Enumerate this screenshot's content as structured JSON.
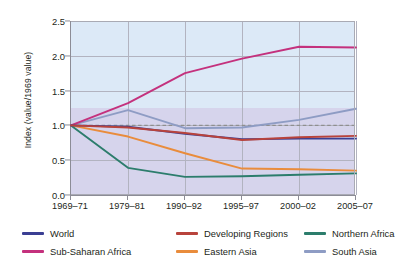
{
  "chart_data": {
    "type": "line",
    "title": "",
    "xlabel": "",
    "ylabel": "Index  (value/1969 value)",
    "categories": [
      "1969–71",
      "1979–81",
      "1990–92",
      "1995–97",
      "2000–02",
      "2005–07"
    ],
    "ylim": [
      0.0,
      2.5
    ],
    "yticks": [
      "0.0",
      "0.5",
      "1.0",
      "1.5",
      "2.0",
      "2.5"
    ],
    "ytick_values": [
      0.0,
      0.5,
      1.0,
      1.5,
      2.0,
      2.5
    ],
    "grid": "both",
    "legend_position": "bottom",
    "reference_line": {
      "value": 1.0,
      "style": "dashed",
      "color": "#8f8f8f"
    },
    "background_bands": [
      {
        "range": [
          1.0,
          2.5
        ],
        "color": "#dce9f7"
      },
      {
        "range": [
          0.0,
          1.0
        ],
        "color": "#d6d4ec"
      }
    ],
    "series": [
      {
        "name": "World",
        "color": "#3b3f93",
        "values": [
          1.0,
          0.98,
          0.88,
          0.8,
          0.81,
          0.81
        ]
      },
      {
        "name": "Sub-Saharan Africa",
        "color": "#c4317d",
        "values": [
          1.0,
          1.32,
          1.75,
          1.96,
          2.13,
          2.12
        ]
      },
      {
        "name": "Developing Regions",
        "color": "#b8433c",
        "values": [
          1.0,
          0.97,
          0.89,
          0.79,
          0.83,
          0.85
        ]
      },
      {
        "name": "Eastern Asia",
        "color": "#e98c3c",
        "values": [
          1.0,
          0.84,
          0.6,
          0.38,
          0.37,
          0.35
        ]
      },
      {
        "name": "Northern Africa",
        "color": "#2c7d6c",
        "values": [
          1.0,
          0.39,
          0.26,
          0.27,
          0.29,
          0.31
        ]
      },
      {
        "name": "South Asia",
        "color": "#8e9cc4",
        "values": [
          1.0,
          1.22,
          0.96,
          0.97,
          1.08,
          1.24
        ]
      }
    ]
  },
  "legend": {
    "items": [
      {
        "label": "World",
        "color": "#3b3f93"
      },
      {
        "label": "Developing Regions",
        "color": "#b8433c"
      },
      {
        "label": "Northern Africa",
        "color": "#2c7d6c"
      },
      {
        "label": "Sub-Saharan Africa",
        "color": "#c4317d"
      },
      {
        "label": "Eastern Asia",
        "color": "#e98c3c"
      },
      {
        "label": "South Asia",
        "color": "#8e9cc4"
      }
    ]
  }
}
